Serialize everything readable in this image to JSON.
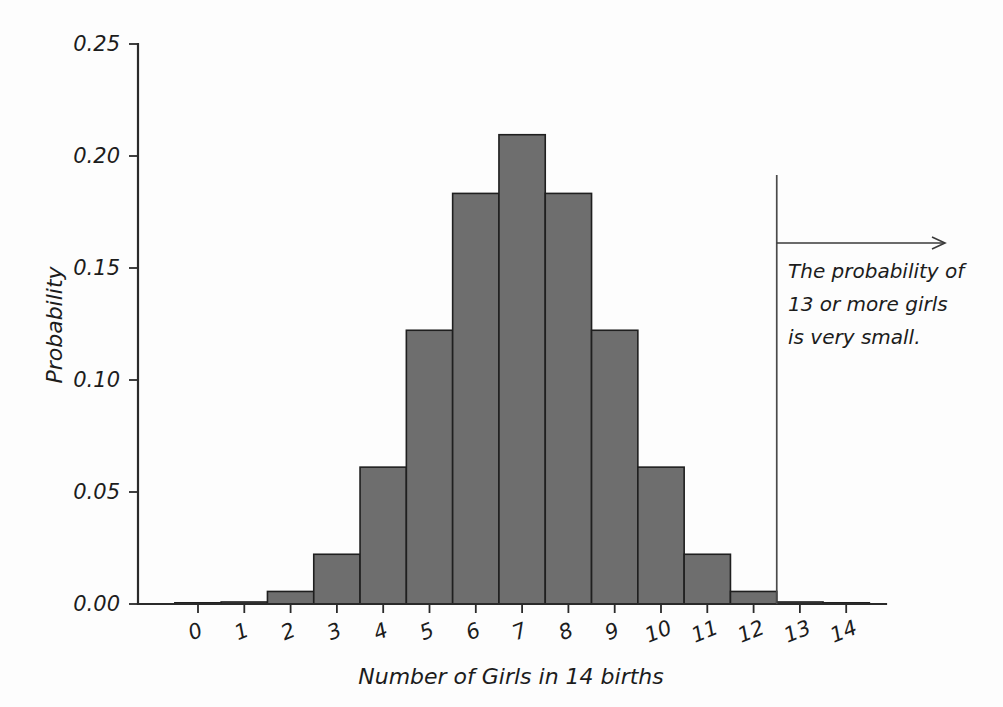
{
  "chart_data": {
    "type": "bar",
    "title": "",
    "subtitle": "",
    "xlabel": "Number of Girls in 14 births",
    "ylabel": "Probability",
    "categories": [
      "0",
      "1",
      "2",
      "3",
      "4",
      "5",
      "6",
      "7",
      "8",
      "9",
      "10",
      "11",
      "12",
      "13",
      "14"
    ],
    "values": [
      0.0001,
      0.0009,
      0.0056,
      0.0222,
      0.0611,
      0.1222,
      0.1833,
      0.2095,
      0.1833,
      0.1222,
      0.0611,
      0.0222,
      0.0056,
      0.0009,
      0.0001
    ],
    "xlim": [
      -0.5,
      14.5
    ],
    "ylim": [
      0.0,
      0.25
    ],
    "ytick_values": [
      0.0,
      0.05,
      0.1,
      0.15,
      0.2,
      0.25
    ],
    "ytick_labels": [
      "0.00",
      "0.05",
      "0.10",
      "0.15",
      "0.20",
      "0.25"
    ],
    "xtick_labels": [
      "0",
      "1",
      "2",
      "3",
      "4",
      "5",
      "6",
      "7",
      "8",
      "9",
      "10",
      "11",
      "12",
      "13",
      "14"
    ],
    "grid": false,
    "legend": "none",
    "bar_fill_color": "#6e6e6e",
    "bar_edge_color": "#1f1f1f",
    "axis_color": "#2a2a2a",
    "background_color": "#fdfdfd"
  },
  "annotation": {
    "line1": "The probability of",
    "line2": "13 or more girls",
    "line3": "is very small.",
    "marker_x_value": 12.5,
    "arrow_direction": "right"
  }
}
